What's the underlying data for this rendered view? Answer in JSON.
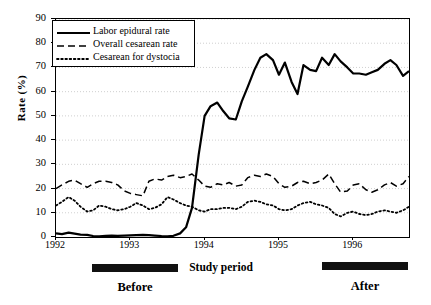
{
  "chart_data": {
    "type": "line",
    "title": "",
    "xlabel": "Study period",
    "ylabel": "Rate (%)",
    "ylim": [
      0,
      90
    ],
    "ytick_labels": [
      "0",
      "10",
      "20",
      "30",
      "40",
      "50",
      "60",
      "70",
      "80",
      "90"
    ],
    "ytick_values": [
      0,
      10,
      20,
      30,
      40,
      50,
      60,
      70,
      80,
      90
    ],
    "xtick_labels": [
      "1992",
      "1993",
      "1994",
      "1995",
      "1996"
    ],
    "xtick_values": [
      1992,
      1993,
      1994,
      1995,
      1996
    ],
    "xlim": [
      1992,
      1996.75
    ],
    "grid": "horizontal-dotted",
    "legend_position": "top-left-inside",
    "annotations": [
      {
        "name": "before-bar",
        "label": "Before",
        "x_start": 1992.5,
        "x_end": 1993.65
      },
      {
        "name": "after-bar",
        "label": "After",
        "x_start": 1995.6,
        "x_end": 1996.75
      }
    ],
    "series": [
      {
        "name": "Labor epidural rate",
        "style": "solid",
        "color": "#000000",
        "x": [
          1992.0,
          1992.08,
          1992.17,
          1992.25,
          1992.33,
          1992.42,
          1992.5,
          1992.58,
          1992.67,
          1992.75,
          1992.83,
          1992.92,
          1993.0,
          1993.08,
          1993.17,
          1993.25,
          1993.33,
          1993.42,
          1993.5,
          1993.58,
          1993.67,
          1993.75,
          1993.83,
          1993.92,
          1994.0,
          1994.08,
          1994.17,
          1994.25,
          1994.33,
          1994.42,
          1994.5,
          1994.58,
          1994.67,
          1994.75,
          1994.83,
          1994.92,
          1995.0,
          1995.08,
          1995.17,
          1995.25,
          1995.33,
          1995.42,
          1995.5,
          1995.58,
          1995.67,
          1995.75,
          1995.83,
          1995.92,
          1996.0,
          1996.08,
          1996.17,
          1996.25,
          1996.33,
          1996.42,
          1996.5,
          1996.58,
          1996.67,
          1996.75
        ],
        "values": [
          1.5,
          1.2,
          1.8,
          1.4,
          1.0,
          0.9,
          0.4,
          0.3,
          0.5,
          0.6,
          0.5,
          0.6,
          0.7,
          0.8,
          0.9,
          0.8,
          0.6,
          0.4,
          0.3,
          0.5,
          1.5,
          4.0,
          12.0,
          34.0,
          50.0,
          54.0,
          55.5,
          52.0,
          49.0,
          48.5,
          56.0,
          62.0,
          69.0,
          74.0,
          75.5,
          73.0,
          67.0,
          72.0,
          64.0,
          59.0,
          71.0,
          69.0,
          68.5,
          74.0,
          71.0,
          75.5,
          72.5,
          70.0,
          67.5,
          67.5,
          67.0,
          68.0,
          69.0,
          71.5,
          73.0,
          71.0,
          66.5,
          68.5
        ]
      },
      {
        "name": "Overall cesarean rate",
        "style": "dashed",
        "color": "#000000",
        "x": [
          1992.0,
          1992.08,
          1992.17,
          1992.25,
          1992.33,
          1992.42,
          1992.5,
          1992.58,
          1992.67,
          1992.75,
          1992.83,
          1992.92,
          1993.0,
          1993.08,
          1993.17,
          1993.25,
          1993.33,
          1993.42,
          1993.5,
          1993.58,
          1993.67,
          1993.75,
          1993.83,
          1993.92,
          1994.0,
          1994.08,
          1994.17,
          1994.25,
          1994.33,
          1994.42,
          1994.5,
          1994.58,
          1994.67,
          1994.75,
          1994.83,
          1994.92,
          1995.0,
          1995.08,
          1995.17,
          1995.25,
          1995.33,
          1995.42,
          1995.5,
          1995.58,
          1995.67,
          1995.75,
          1995.83,
          1995.92,
          1996.0,
          1996.08,
          1996.17,
          1996.25,
          1996.33,
          1996.42,
          1996.5,
          1996.58,
          1996.67,
          1996.75
        ],
        "values": [
          20.0,
          21.5,
          23.0,
          23.5,
          22.0,
          20.5,
          22.0,
          23.0,
          23.0,
          22.5,
          21.5,
          19.0,
          18.0,
          17.5,
          17.0,
          23.0,
          24.0,
          23.5,
          25.0,
          25.5,
          24.5,
          25.0,
          26.0,
          23.5,
          21.0,
          20.5,
          22.0,
          21.5,
          22.5,
          21.0,
          21.5,
          24.5,
          25.5,
          25.0,
          26.0,
          25.0,
          22.0,
          20.5,
          21.0,
          22.5,
          23.0,
          22.0,
          22.5,
          23.5,
          26.0,
          22.0,
          18.5,
          19.0,
          21.5,
          22.0,
          19.5,
          18.5,
          19.5,
          21.5,
          22.5,
          21.0,
          22.0,
          25.0
        ]
      },
      {
        "name": "Cesarean for dystocia",
        "style": "dotted",
        "color": "#000000",
        "x": [
          1992.0,
          1992.08,
          1992.17,
          1992.25,
          1992.33,
          1992.42,
          1992.5,
          1992.58,
          1992.67,
          1992.75,
          1992.83,
          1992.92,
          1993.0,
          1993.08,
          1993.17,
          1993.25,
          1993.33,
          1993.42,
          1993.5,
          1993.58,
          1993.67,
          1993.75,
          1993.83,
          1993.92,
          1994.0,
          1994.08,
          1994.17,
          1994.25,
          1994.33,
          1994.42,
          1994.5,
          1994.58,
          1994.67,
          1994.75,
          1994.83,
          1994.92,
          1995.0,
          1995.08,
          1995.17,
          1995.25,
          1995.33,
          1995.42,
          1995.5,
          1995.58,
          1995.67,
          1995.75,
          1995.83,
          1995.92,
          1996.0,
          1996.08,
          1996.17,
          1996.25,
          1996.33,
          1996.42,
          1996.5,
          1996.58,
          1996.67,
          1996.75
        ],
        "values": [
          13.0,
          14.5,
          16.5,
          15.0,
          12.5,
          10.5,
          11.0,
          13.0,
          12.5,
          11.5,
          11.0,
          11.5,
          12.5,
          14.0,
          13.0,
          11.5,
          12.0,
          13.5,
          16.5,
          15.5,
          14.0,
          13.0,
          12.5,
          11.0,
          10.5,
          11.5,
          11.5,
          12.0,
          12.0,
          11.5,
          12.5,
          14.5,
          15.0,
          14.5,
          13.5,
          13.0,
          11.5,
          11.0,
          11.5,
          13.0,
          14.0,
          14.5,
          13.5,
          13.0,
          12.0,
          9.5,
          8.5,
          10.0,
          10.5,
          9.5,
          9.0,
          9.5,
          10.5,
          11.0,
          10.5,
          10.0,
          11.0,
          12.5
        ]
      }
    ]
  },
  "legend": {
    "items": [
      {
        "label": "Labor epidural rate",
        "style": "solid"
      },
      {
        "label": "Overall cesarean rate",
        "style": "dashed"
      },
      {
        "label": "Cesarean for dystocia",
        "style": "dotted"
      }
    ]
  },
  "axis": {
    "y_title": "Rate (%)",
    "x_title": "Study period"
  },
  "period_labels": {
    "before": "Before",
    "after": "After"
  }
}
